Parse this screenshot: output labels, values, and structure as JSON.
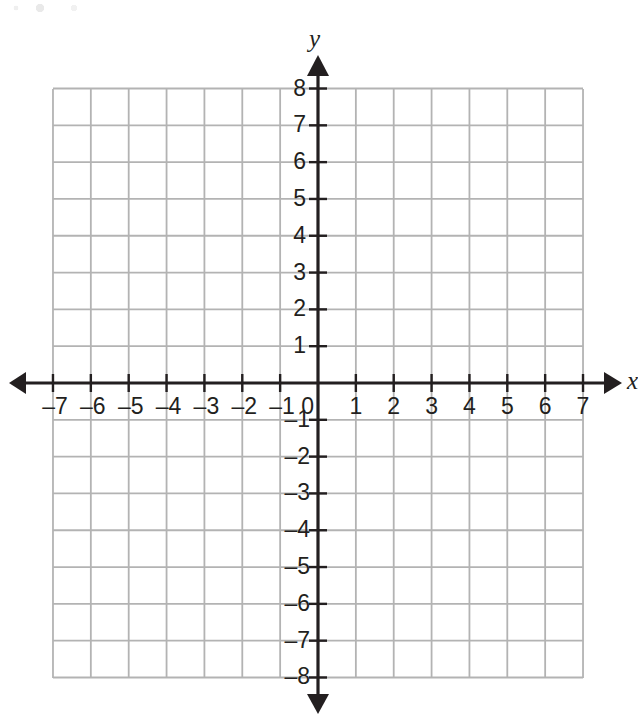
{
  "chart_data": {
    "type": "scatter",
    "title": "",
    "subtitle": "",
    "xlabel": "x",
    "ylabel": "y",
    "xlim": [
      -7,
      7
    ],
    "ylim": [
      -8,
      8
    ],
    "xticks": [
      -7,
      -6,
      -5,
      -4,
      -3,
      -2,
      -1,
      0,
      1,
      2,
      3,
      4,
      5,
      6,
      7
    ],
    "yticks": [
      -8,
      -7,
      -6,
      -5,
      -4,
      -3,
      -2,
      -1,
      0,
      1,
      2,
      3,
      4,
      5,
      6,
      7,
      8
    ],
    "xtick_labels": [
      "–7",
      "–6",
      "–5",
      "–4",
      "–3",
      "–2",
      "–1",
      "0",
      "1",
      "2",
      "3",
      "4",
      "5",
      "6",
      "7"
    ],
    "ytick_labels_positive": [
      "8",
      "7",
      "6",
      "5",
      "4",
      "3",
      "2",
      "1"
    ],
    "ytick_labels_negative": [
      "–1",
      "–2",
      "–3",
      "–4",
      "–5",
      "–6",
      "–7",
      "–8"
    ],
    "origin_label": "0",
    "grid": true,
    "grid_step_x": 1,
    "grid_step_y": 1,
    "legend": "none",
    "series": [],
    "values": [],
    "categories": [],
    "annotations": [],
    "axis_arrows": [
      "left",
      "right",
      "up",
      "down"
    ]
  },
  "colors": {
    "background": "#ffffff",
    "grid_line": "#b3b3b3",
    "axis_line": "#231f20",
    "text": "#231f20"
  },
  "axes": {
    "x_axis_name": "x",
    "y_axis_name": "y"
  },
  "geometry": {
    "origin_x_px": 318,
    "origin_y_px": 383,
    "cell_width_px": 37.86,
    "cell_height_px": 36.81,
    "grid_left_px": 53,
    "grid_right_px": 583,
    "grid_top_px": 89,
    "grid_bottom_px": 678
  }
}
